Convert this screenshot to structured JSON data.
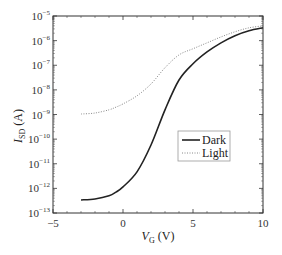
{
  "chart_data": {
    "type": "line",
    "title": "",
    "xlabel": "V_G (V)",
    "xlabel_main": "V",
    "xlabel_sub": "G",
    "xlabel_unit": " (V)",
    "ylabel": "I_SD (A)",
    "ylabel_main": "I",
    "ylabel_sub": "SD",
    "ylabel_unit": " (A)",
    "xlim": [
      -5,
      10
    ],
    "ylim": [
      1e-13,
      1e-05
    ],
    "yscale": "log",
    "grid": false,
    "legend_position": "center-right",
    "x_ticks": [
      -5,
      0,
      5,
      10
    ],
    "x_tick_labels": [
      "−5",
      "0",
      "5",
      "10"
    ],
    "y_ticks_exp": [
      -13,
      -12,
      -11,
      -10,
      -9,
      -8,
      -7,
      -6,
      -5
    ],
    "y_tick_labels": [
      "10^-13",
      "10^-12",
      "10^-11",
      "10^-10",
      "10^-9",
      "10^-8",
      "10^-7",
      "10^-6",
      "10^-5"
    ],
    "x": [
      -3,
      -2,
      -1,
      -0.5,
      0,
      1,
      2,
      3,
      4,
      5,
      6,
      7,
      8,
      9,
      10
    ],
    "series": [
      {
        "name": "Dark",
        "style": "solid",
        "color": "#222222",
        "log10_values": [
          -12.47,
          -12.43,
          -12.3,
          -12.15,
          -11.94,
          -11.33,
          -10.24,
          -8.81,
          -7.6,
          -6.94,
          -6.46,
          -6.09,
          -5.8,
          -5.6,
          -5.48
        ]
      },
      {
        "name": "Light",
        "style": "dotted",
        "color": "#888888",
        "log10_values": [
          -8.98,
          -8.94,
          -8.81,
          -8.7,
          -8.57,
          -8.24,
          -7.76,
          -7.1,
          -6.58,
          -6.33,
          -6.09,
          -5.85,
          -5.64,
          -5.48,
          -5.4
        ]
      }
    ]
  },
  "legend": {
    "items": [
      {
        "label": "Dark"
      },
      {
        "label": "Light"
      }
    ]
  }
}
